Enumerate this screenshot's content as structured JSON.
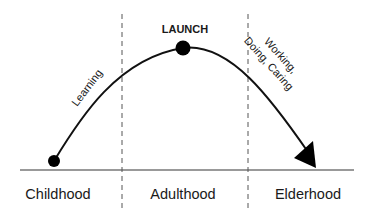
{
  "diagram": {
    "peak_label": "LAUNCH",
    "rising_label": "Learning",
    "falling_label_line1": "Working,",
    "falling_label_line2": "Doing, Caring",
    "stages": [
      {
        "label": "Childhood"
      },
      {
        "label": "Adulthood"
      },
      {
        "label": "Elderhood"
      }
    ],
    "colors": {
      "line": "#111111",
      "baseline": "#777777",
      "divider": "#555555",
      "text": "#1a1a1a"
    }
  }
}
